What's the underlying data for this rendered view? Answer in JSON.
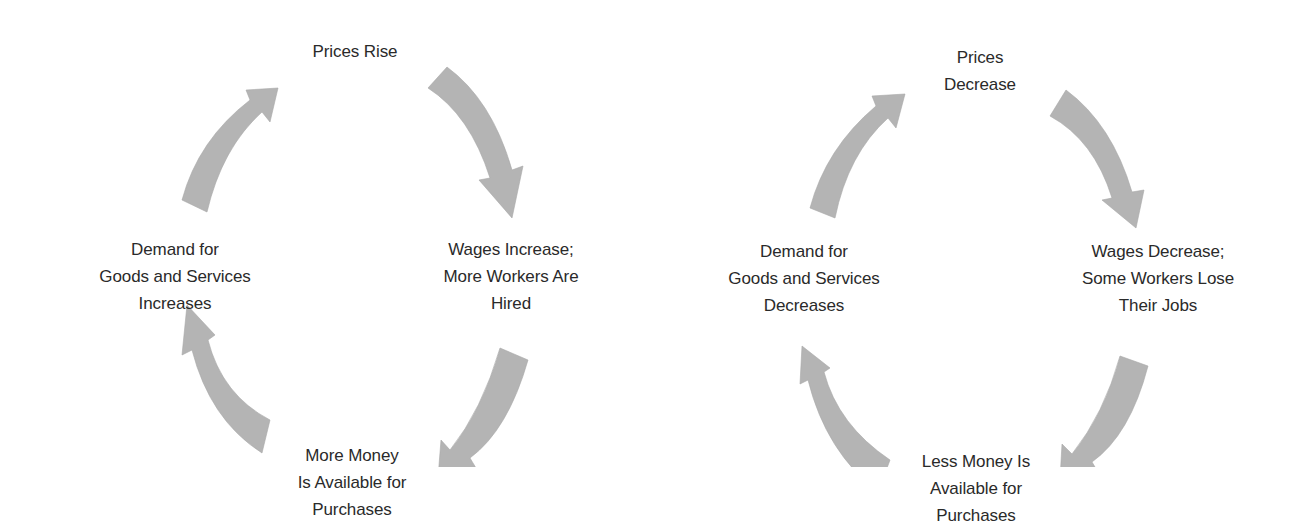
{
  "diagrams": [
    {
      "name": "inflationary-cycle",
      "arrow_color": "#b4b4b4",
      "nodes": {
        "top": {
          "lines": [
            "Prices Rise"
          ]
        },
        "right": {
          "lines": [
            "Wages Increase;",
            "More Workers Are",
            "Hired"
          ]
        },
        "bottom": {
          "lines": [
            "More Money",
            "Is Available for",
            "Purchases"
          ]
        },
        "left": {
          "lines": [
            "Demand for",
            "Goods and Services",
            "Increases"
          ]
        }
      },
      "flow": [
        "top",
        "right",
        "bottom",
        "left",
        "top"
      ]
    },
    {
      "name": "deflationary-cycle",
      "arrow_color": "#b4b4b4",
      "nodes": {
        "top": {
          "lines": [
            "Prices",
            "Decrease"
          ]
        },
        "right": {
          "lines": [
            "Wages Decrease;",
            "Some Workers Lose",
            "Their Jobs"
          ]
        },
        "bottom": {
          "lines": [
            "Less Money Is",
            "Available for",
            "Purchases"
          ]
        },
        "left": {
          "lines": [
            "Demand for",
            "Goods and Services",
            "Decreases"
          ]
        }
      },
      "flow": [
        "top",
        "right",
        "bottom",
        "left",
        "top"
      ]
    }
  ]
}
